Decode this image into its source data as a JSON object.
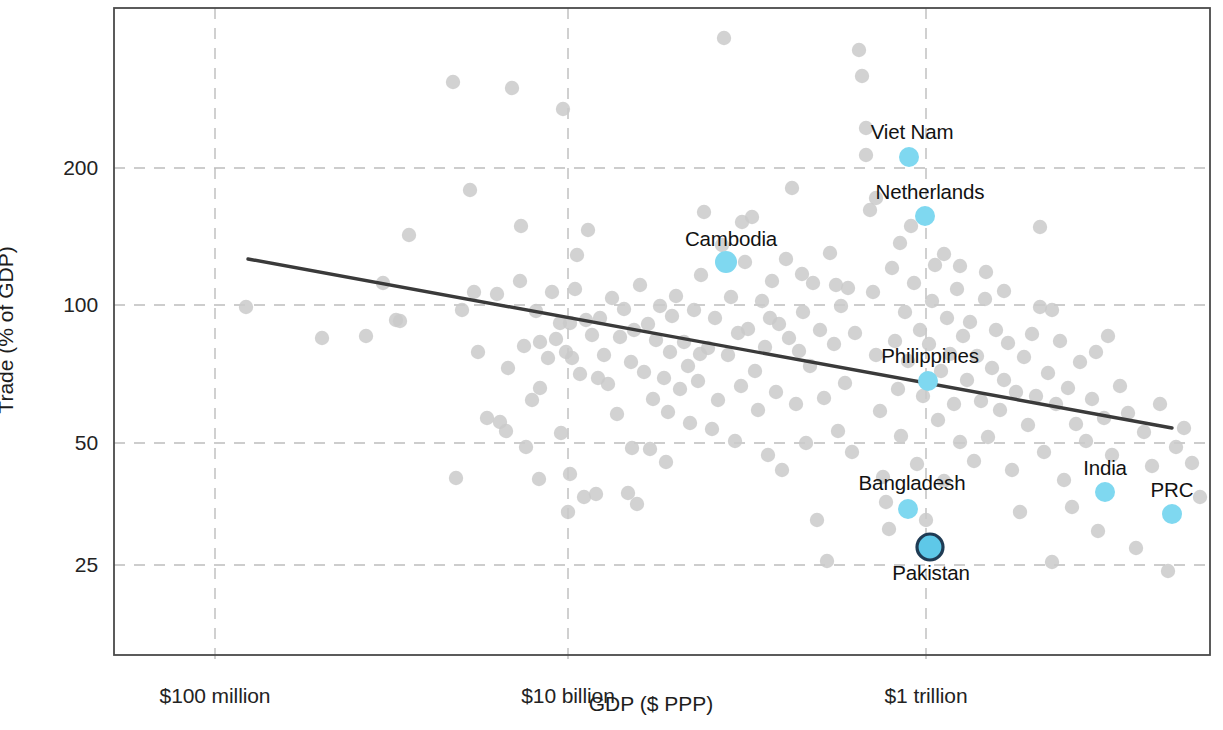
{
  "chart_data": {
    "type": "scatter",
    "title": "",
    "xlabel": "GDP ($ PPP)",
    "ylabel": "Trade (% of GDP)",
    "x_scale": "log",
    "y_scale": "log",
    "grid": true,
    "legend": "none",
    "x_ticks": [
      {
        "label": "$100 million",
        "value": 100000000,
        "px": 215
      },
      {
        "label": "$10 billion",
        "value": 10000000000,
        "px": 568
      },
      {
        "label": "$1 trillion",
        "value": 1000000000000,
        "px": 926
      }
    ],
    "y_ticks": [
      {
        "label": "200",
        "value": 200,
        "px": 168
      },
      {
        "label": "100",
        "value": 100,
        "px": 305
      },
      {
        "label": "50",
        "value": 50,
        "px": 443
      },
      {
        "label": "25",
        "value": 25,
        "px": 565
      }
    ],
    "xlim_px": [
      114,
      1210
    ],
    "ylim_px": [
      8,
      655
    ],
    "colors": {
      "background": "#ffffff",
      "frame": "#4a4a4a",
      "gridline": "#bdbdbd",
      "point_default": "#cacaca",
      "point_highlight": "#7fd8f0",
      "point_focus_fill": "#5ec8e8",
      "point_focus_stroke": "#1f3b54",
      "trendline": "#3a3a3a",
      "text": "#1a1a1a"
    },
    "trendline": {
      "name": "fitted trend",
      "x1_px": 248,
      "y1_px": 259,
      "x2_px": 1172,
      "y2_px": 428,
      "approx_y_start": 130,
      "approx_y_end": 54,
      "width_px": 3.4
    },
    "highlighted_points": [
      {
        "name": "Viet Nam",
        "label_x": 912,
        "label_y": 132,
        "cx": 909,
        "cy": 157,
        "r": 10,
        "trade_pct": 208,
        "type": "highlight"
      },
      {
        "name": "Netherlands",
        "label_x": 930,
        "label_y": 192,
        "cx": 925,
        "cy": 216,
        "r": 10,
        "trade_pct": 165,
        "type": "highlight"
      },
      {
        "name": "Cambodia",
        "label_x": 731,
        "label_y": 239,
        "cx": 726,
        "cy": 262,
        "r": 11,
        "trade_pct": 127,
        "type": "highlight"
      },
      {
        "name": "Philippines",
        "label_x": 930,
        "label_y": 356,
        "cx": 928,
        "cy": 381,
        "r": 10,
        "trade_pct": 72,
        "type": "highlight"
      },
      {
        "name": "India",
        "label_x": 1105,
        "label_y": 468,
        "cx": 1105,
        "cy": 492,
        "r": 10,
        "trade_pct": 40,
        "type": "highlight"
      },
      {
        "name": "PRC",
        "label_x": 1172,
        "label_y": 490,
        "cx": 1172,
        "cy": 514,
        "r": 10,
        "trade_pct": 36,
        "type": "highlight"
      },
      {
        "name": "Bangladesh",
        "label_x": 912,
        "label_y": 483,
        "cx": 908,
        "cy": 509,
        "r": 10,
        "trade_pct": 37,
        "type": "highlight"
      },
      {
        "name": "Pakistan",
        "label_x": 931,
        "label_y": 573,
        "cx": 930,
        "cy": 547,
        "r": 13,
        "trade_pct": 30,
        "type": "focus"
      }
    ],
    "background_points_px": [
      [
        246,
        307
      ],
      [
        322,
        338
      ],
      [
        366,
        336
      ],
      [
        383,
        283
      ],
      [
        396,
        320
      ],
      [
        400,
        321
      ],
      [
        409,
        235
      ],
      [
        453,
        82
      ],
      [
        456,
        478
      ],
      [
        462,
        310
      ],
      [
        470,
        190
      ],
      [
        474,
        292
      ],
      [
        487,
        418
      ],
      [
        497,
        294
      ],
      [
        500,
        422
      ],
      [
        506,
        431
      ],
      [
        512,
        88
      ],
      [
        520,
        281
      ],
      [
        521,
        226
      ],
      [
        524,
        346
      ],
      [
        526,
        447
      ],
      [
        532,
        400
      ],
      [
        536,
        311
      ],
      [
        539,
        479
      ],
      [
        540,
        342
      ],
      [
        548,
        358
      ],
      [
        552,
        292
      ],
      [
        556,
        339
      ],
      [
        560,
        323
      ],
      [
        561,
        433
      ],
      [
        563,
        109
      ],
      [
        566,
        352
      ],
      [
        568,
        512
      ],
      [
        570,
        323
      ],
      [
        572,
        358
      ],
      [
        575,
        289
      ],
      [
        577,
        255
      ],
      [
        580,
        374
      ],
      [
        584,
        497
      ],
      [
        586,
        320
      ],
      [
        588,
        230
      ],
      [
        592,
        335
      ],
      [
        596,
        494
      ],
      [
        600,
        318
      ],
      [
        604,
        355
      ],
      [
        608,
        384
      ],
      [
        612,
        298
      ],
      [
        617,
        414
      ],
      [
        620,
        337
      ],
      [
        624,
        309
      ],
      [
        628,
        493
      ],
      [
        631,
        362
      ],
      [
        634,
        330
      ],
      [
        637,
        504
      ],
      [
        640,
        285
      ],
      [
        644,
        372
      ],
      [
        648,
        324
      ],
      [
        650,
        449
      ],
      [
        653,
        399
      ],
      [
        656,
        340
      ],
      [
        660,
        306
      ],
      [
        664,
        378
      ],
      [
        668,
        412
      ],
      [
        670,
        352
      ],
      [
        672,
        316
      ],
      [
        676,
        296
      ],
      [
        680,
        389
      ],
      [
        684,
        342
      ],
      [
        688,
        366
      ],
      [
        690,
        423
      ],
      [
        694,
        310
      ],
      [
        698,
        381
      ],
      [
        701,
        275
      ],
      [
        704,
        212
      ],
      [
        708,
        348
      ],
      [
        712,
        429
      ],
      [
        715,
        318
      ],
      [
        718,
        400
      ],
      [
        722,
        245
      ],
      [
        724,
        38
      ],
      [
        728,
        355
      ],
      [
        731,
        297
      ],
      [
        735,
        441
      ],
      [
        738,
        333
      ],
      [
        741,
        386
      ],
      [
        745,
        262
      ],
      [
        748,
        329
      ],
      [
        752,
        217
      ],
      [
        755,
        371
      ],
      [
        758,
        410
      ],
      [
        762,
        301
      ],
      [
        765,
        347
      ],
      [
        768,
        455
      ],
      [
        772,
        281
      ],
      [
        776,
        392
      ],
      [
        779,
        324
      ],
      [
        782,
        470
      ],
      [
        786,
        259
      ],
      [
        789,
        338
      ],
      [
        792,
        188
      ],
      [
        796,
        404
      ],
      [
        799,
        351
      ],
      [
        803,
        312
      ],
      [
        806,
        443
      ],
      [
        810,
        366
      ],
      [
        813,
        283
      ],
      [
        817,
        520
      ],
      [
        820,
        330
      ],
      [
        824,
        398
      ],
      [
        827,
        561
      ],
      [
        830,
        253
      ],
      [
        834,
        344
      ],
      [
        838,
        431
      ],
      [
        841,
        306
      ],
      [
        845,
        383
      ],
      [
        848,
        288
      ],
      [
        852,
        452
      ],
      [
        855,
        333
      ],
      [
        859,
        50
      ],
      [
        862,
        76
      ],
      [
        866,
        128
      ],
      [
        870,
        210
      ],
      [
        873,
        292
      ],
      [
        876,
        355
      ],
      [
        880,
        411
      ],
      [
        883,
        477
      ],
      [
        886,
        502
      ],
      [
        889,
        529
      ],
      [
        892,
        268
      ],
      [
        895,
        341
      ],
      [
        898,
        389
      ],
      [
        901,
        436
      ],
      [
        905,
        312
      ],
      [
        908,
        361
      ],
      [
        911,
        226
      ],
      [
        914,
        283
      ],
      [
        917,
        464
      ],
      [
        920,
        330
      ],
      [
        923,
        396
      ],
      [
        926,
        520
      ],
      [
        929,
        344
      ],
      [
        932,
        301
      ],
      [
        935,
        265
      ],
      [
        938,
        420
      ],
      [
        941,
        371
      ],
      [
        944,
        481
      ],
      [
        947,
        318
      ],
      [
        950,
        354
      ],
      [
        954,
        404
      ],
      [
        957,
        289
      ],
      [
        960,
        442
      ],
      [
        963,
        336
      ],
      [
        967,
        380
      ],
      [
        970,
        322
      ],
      [
        974,
        461
      ],
      [
        977,
        356
      ],
      [
        981,
        401
      ],
      [
        985,
        299
      ],
      [
        988,
        437
      ],
      [
        992,
        368
      ],
      [
        996,
        330
      ],
      [
        1000,
        410
      ],
      [
        1004,
        380
      ],
      [
        1008,
        343
      ],
      [
        1012,
        470
      ],
      [
        1016,
        392
      ],
      [
        1020,
        512
      ],
      [
        1024,
        357
      ],
      [
        1028,
        425
      ],
      [
        1032,
        334
      ],
      [
        1036,
        396
      ],
      [
        1040,
        307
      ],
      [
        1044,
        452
      ],
      [
        1048,
        373
      ],
      [
        1052,
        562
      ],
      [
        1056,
        404
      ],
      [
        1060,
        341
      ],
      [
        1064,
        480
      ],
      [
        1068,
        388
      ],
      [
        1072,
        507
      ],
      [
        1076,
        424
      ],
      [
        1080,
        362
      ],
      [
        1086,
        441
      ],
      [
        1092,
        399
      ],
      [
        1098,
        531
      ],
      [
        1104,
        418
      ],
      [
        1112,
        455
      ],
      [
        1120,
        386
      ],
      [
        1128,
        413
      ],
      [
        1136,
        548
      ],
      [
        1144,
        432
      ],
      [
        1152,
        466
      ],
      [
        1160,
        404
      ],
      [
        1168,
        571
      ],
      [
        1176,
        447
      ],
      [
        1184,
        428
      ],
      [
        1192,
        463
      ],
      [
        1200,
        497
      ],
      [
        1108,
        336
      ],
      [
        1052,
        310
      ],
      [
        1004,
        291
      ],
      [
        960,
        266
      ],
      [
        1040,
        227
      ],
      [
        1096,
        352
      ],
      [
        876,
        198
      ],
      [
        900,
        243
      ],
      [
        944,
        254
      ],
      [
        986,
        272
      ],
      [
        866,
        155
      ],
      [
        836,
        285
      ],
      [
        802,
        274
      ],
      [
        770,
        318
      ],
      [
        742,
        222
      ],
      [
        700,
        354
      ],
      [
        666,
        462
      ],
      [
        632,
        448
      ],
      [
        598,
        378
      ],
      [
        570,
        474
      ],
      [
        540,
        388
      ],
      [
        508,
        368
      ],
      [
        478,
        352
      ]
    ],
    "n_background_points": 220
  },
  "axes": {
    "y_title": "Trade (% of GDP)",
    "x_title": "GDP ($ PPP)",
    "y_tick_labels": [
      "200",
      "100",
      "50",
      "25"
    ],
    "x_tick_labels": [
      "$100 million",
      "$10 billion",
      "$1 trillion"
    ]
  },
  "labels": {
    "viet_nam": "Viet Nam",
    "netherlands": "Netherlands",
    "cambodia": "Cambodia",
    "philippines": "Philippines",
    "india": "India",
    "prc": "PRC",
    "bangladesh": "Bangladesh",
    "pakistan": "Pakistan"
  }
}
